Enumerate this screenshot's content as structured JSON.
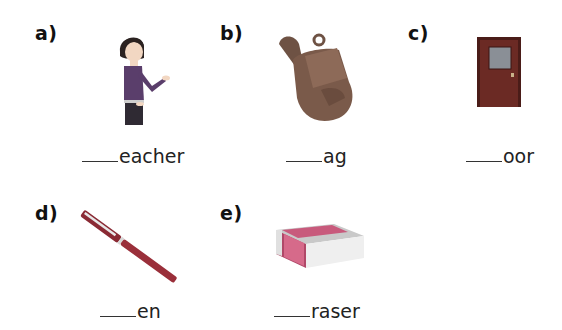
{
  "worksheet": {
    "items": [
      {
        "label": "a)",
        "picture": "teacher",
        "blank": "____",
        "suffix": "eacher"
      },
      {
        "label": "b)",
        "picture": "bag",
        "blank": "____",
        "suffix": "ag"
      },
      {
        "label": "c)",
        "picture": "door",
        "blank": "____",
        "suffix": "oor"
      },
      {
        "label": "d)",
        "picture": "pen",
        "blank": "____",
        "suffix": "en"
      },
      {
        "label": "e)",
        "picture": "eraser",
        "blank": "____",
        "suffix": "raser"
      }
    ]
  },
  "colors": {
    "teacher_top": "#5a3e6b",
    "teacher_hair": "#2b2220",
    "bag": "#7a5a4a",
    "door": "#6b2a24",
    "pen": "#9a2f3a",
    "eraser": "#d66a8a"
  }
}
